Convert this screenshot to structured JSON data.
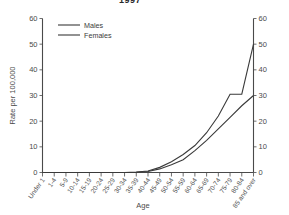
{
  "chart_data": {
    "type": "line",
    "title": "1997",
    "xlabel": "Age",
    "ylabel": "Rate per 100,000",
    "categories": [
      "Under 1",
      "1-4",
      "5-9",
      "10-14",
      "15-19",
      "20-24",
      "25-29",
      "30-34",
      "35-39",
      "40-44",
      "45-49",
      "50-54",
      "55-59",
      "60-64",
      "65-69",
      "70-74",
      "75-79",
      "80-84",
      "85 and over"
    ],
    "series": [
      {
        "name": "Males",
        "color": "#3a3a3a",
        "values": [
          0,
          0,
          0,
          0,
          0,
          0,
          0,
          0,
          0.2,
          0.6,
          2.0,
          4.2,
          7.0,
          10.5,
          15.5,
          22.0,
          30.5,
          30.5,
          50.0
        ]
      },
      {
        "name": "Females",
        "color": "#3a3a3a",
        "values": [
          0,
          0,
          0,
          0,
          0,
          0,
          0,
          0,
          0.1,
          0.4,
          1.4,
          3.0,
          5.0,
          8.5,
          12.5,
          17.0,
          21.5,
          26.0,
          30.0
        ]
      }
    ],
    "ylim": [
      0,
      60
    ],
    "yticks": [
      0,
      10,
      20,
      30,
      40,
      50,
      60
    ],
    "yticks_right": [
      0,
      10,
      20,
      30,
      40,
      50,
      60
    ],
    "grid": false,
    "legend_position": "top-left",
    "axis_color": "#4a4a4a",
    "background": "#ffffff"
  },
  "legend": {
    "items": [
      {
        "label": "Males"
      },
      {
        "label": "Females"
      }
    ]
  }
}
